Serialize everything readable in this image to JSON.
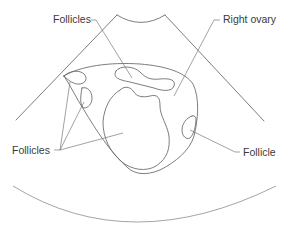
{
  "diagram": {
    "type": "ultrasound-schematic",
    "labels": {
      "follicles_top": "Follicles",
      "right_ovary": "Right ovary",
      "follicles_left": "Follicles",
      "follicle_right": "Follicle"
    },
    "colors": {
      "line": "#6e6e6e",
      "text": "#3a3a3a",
      "background": "#ffffff"
    }
  }
}
